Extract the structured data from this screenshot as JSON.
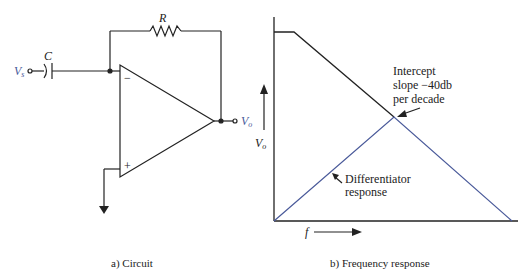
{
  "circuit": {
    "caption": "a) Circuit",
    "labels": {
      "resistor": "R",
      "capacitor": "C",
      "input": "V",
      "input_sub": "s",
      "output": "V",
      "output_sub": "o",
      "inverting": "−",
      "noninverting": "+"
    }
  },
  "graph": {
    "caption": "b) Frequency response",
    "y_label": "V",
    "y_label_sub": "o",
    "x_label": "f",
    "annotations": {
      "intercept_line1": "Intercept",
      "intercept_line2": "slope −40db",
      "intercept_line3": "per decade",
      "diff_line1": "Differentiator",
      "diff_line2": "response"
    },
    "colors": {
      "open_loop": "#222222",
      "differentiator": "#4a5a9a"
    }
  }
}
